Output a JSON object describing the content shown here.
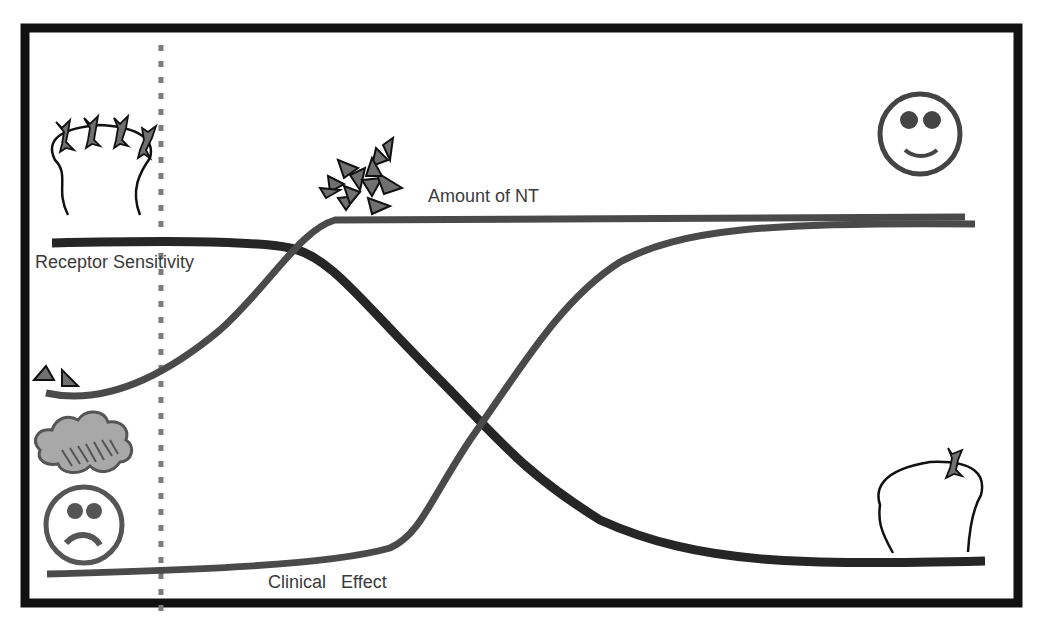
{
  "diagram": {
    "labels": {
      "receptor_sensitivity": "Receptor Sensitivity",
      "amount_of_nt": "Amount of NT",
      "clinical_effect": "Clinical   Effect"
    },
    "curves": [
      {
        "name": "Receptor Sensitivity",
        "trend": "high then falls (sigmoid down)",
        "color": "#262626"
      },
      {
        "name": "Amount of NT",
        "trend": "low then rises quickly to plateau",
        "color": "#4a4a4a"
      },
      {
        "name": "Clinical Effect",
        "trend": "low, rises late to plateau",
        "color": "#4a4a4a"
      }
    ],
    "icons": {
      "top_left": "neuron-with-many-receptors",
      "top_right": "happy-face",
      "bottom_left": "sad-face-with-rain-cloud",
      "bottom_right": "neuron-with-one-receptor",
      "nt_cluster": "many-neurotransmitter-triangles",
      "nt_few": "two-neurotransmitter-triangles"
    },
    "colors": {
      "frame": "#111111",
      "dark_curve": "#262626",
      "gray_curve": "#4a4a4a",
      "dotted_line": "#7a7a7a",
      "icon_fill": "#707070",
      "text": "#3a3a3a"
    }
  }
}
